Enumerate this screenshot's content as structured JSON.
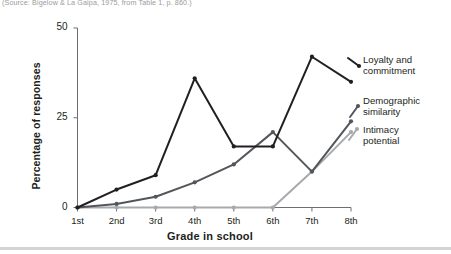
{
  "source_caption": "(Source: Bigelow & La Gaipa, 1975, from Table 1, p. 860.)",
  "chart_data": {
    "type": "line",
    "title": "",
    "xlabel": "Grade in school",
    "ylabel": "Percentage of responses",
    "categories": [
      "1st",
      "2nd",
      "3rd",
      "4th",
      "5th",
      "6th",
      "7th",
      "8th"
    ],
    "ylim": [
      0,
      50
    ],
    "yticks": [
      0,
      25,
      50
    ],
    "ytick_labels": [
      "0",
      "25",
      "50"
    ],
    "grid": false,
    "legend_position": "right",
    "series": [
      {
        "name": "Loyalty and commitment",
        "label_line1": "Loyalty and",
        "label_line2": "commitment",
        "color": "#231f20",
        "values": [
          0,
          5,
          9,
          36,
          17,
          17,
          42,
          35
        ]
      },
      {
        "name": "Demographic similarity",
        "label_line1": "Demographic",
        "label_line2": "similarity",
        "color": "#53565a",
        "values": [
          0,
          1,
          3,
          7,
          12,
          21,
          10,
          24
        ]
      },
      {
        "name": "Intimacy potential",
        "label_line1": "Intimacy",
        "label_line2": "potential",
        "color": "#a7a9ac",
        "values": [
          0,
          0,
          0,
          0,
          0,
          0,
          10,
          21
        ]
      }
    ]
  }
}
